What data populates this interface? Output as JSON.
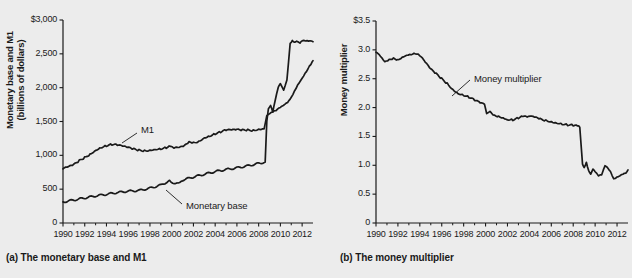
{
  "figure": {
    "background_color": "#ececec",
    "ink_color": "#1a1a1a"
  },
  "panels": [
    {
      "id": "a",
      "caption": "(a) The monetary base and M1",
      "ylabel_line1": "Monetary base and M1",
      "ylabel_line2": "(billions of dollars)",
      "ytick_labels": [
        "$3,000",
        "2,500",
        "2,000",
        "1,500",
        "1,000",
        "500",
        "0"
      ],
      "xtick_labels": [
        "1990",
        "1992",
        "1994",
        "1996",
        "1998",
        "2000",
        "2002",
        "2004",
        "2006",
        "2008",
        "2010",
        "2012"
      ],
      "annotations": [
        {
          "text": "M1",
          "x": 141,
          "y": 131
        },
        {
          "text": "Monetary base",
          "x": 186,
          "y": 207
        }
      ]
    },
    {
      "id": "b",
      "caption": "(b) The money multiplier",
      "ylabel_line1": "Money multiplier",
      "ylabel_line2": "",
      "ytick_labels": [
        "$3.5",
        "3.0",
        "2.5",
        "2.0",
        "1.5",
        "1.0",
        "0.5",
        "0"
      ],
      "xtick_labels": [
        "1990",
        "1992",
        "1994",
        "1996",
        "1998",
        "2000",
        "2002",
        "2004",
        "2006",
        "2008",
        "2010",
        "2012"
      ],
      "annotations": [
        {
          "text": "Money multiplier",
          "x": 474,
          "y": 80
        }
      ]
    }
  ],
  "chart_data": [
    {
      "type": "line",
      "panel": "a",
      "title": "(a) The monetary base and M1",
      "xlabel": "",
      "ylabel": "Monetary base and M1 (billions of dollars)",
      "xlim": [
        1990,
        2013
      ],
      "ylim": [
        0,
        3000
      ],
      "ytick_values": [
        0,
        500,
        1000,
        1500,
        2000,
        2500,
        3000
      ],
      "xtick_values": [
        1990,
        1992,
        1994,
        1996,
        1998,
        2000,
        2002,
        2004,
        2006,
        2008,
        2010,
        2012
      ],
      "grid": false,
      "legend": "inline-annotations",
      "series": [
        {
          "name": "M1",
          "x": [
            1990.0,
            1990.5,
            1991.0,
            1991.5,
            1992.0,
            1992.5,
            1993.0,
            1993.5,
            1994.0,
            1994.5,
            1995.0,
            1995.5,
            1996.0,
            1996.5,
            1997.0,
            1997.5,
            1998.0,
            1998.5,
            1999.0,
            1999.5,
            1999.9,
            2000.2,
            2000.7,
            2001.2,
            2001.6,
            2002.0,
            2002.5,
            2003.0,
            2003.5,
            2004.0,
            2004.5,
            2005.0,
            2005.5,
            2006.0,
            2006.5,
            2007.0,
            2007.5,
            2008.0,
            2008.5,
            2008.75,
            2009.0,
            2009.3,
            2009.6,
            2010.0,
            2010.4,
            2010.8,
            2011.0,
            2011.3,
            2011.6,
            2012.0,
            2012.4,
            2012.8,
            2013.0
          ],
          "y": [
            800,
            825,
            860,
            920,
            970,
            1020,
            1080,
            1120,
            1145,
            1160,
            1150,
            1130,
            1110,
            1090,
            1075,
            1070,
            1080,
            1095,
            1100,
            1115,
            1140,
            1105,
            1110,
            1140,
            1190,
            1185,
            1210,
            1265,
            1290,
            1320,
            1345,
            1370,
            1370,
            1375,
            1370,
            1375,
            1370,
            1390,
            1400,
            1600,
            1625,
            1650,
            1660,
            1700,
            1740,
            1800,
            1850,
            1950,
            2050,
            2150,
            2250,
            2350,
            2400
          ]
        },
        {
          "name": "Monetary base",
          "x": [
            1990.0,
            1991.0,
            1992.0,
            1993.0,
            1994.0,
            1995.0,
            1996.0,
            1997.0,
            1998.0,
            1999.0,
            1999.8,
            2000.1,
            2000.6,
            2001.0,
            2002.0,
            2003.0,
            2004.0,
            2005.0,
            2006.0,
            2007.0,
            2008.0,
            2008.6,
            2008.75,
            2008.9,
            2009.1,
            2009.3,
            2009.5,
            2009.8,
            2010.0,
            2010.3,
            2010.6,
            2010.9,
            2011.1,
            2011.3,
            2011.5,
            2011.8,
            2012.0,
            2012.3,
            2012.6,
            2013.0
          ],
          "y": [
            310,
            340,
            370,
            400,
            425,
            450,
            470,
            480,
            515,
            560,
            625,
            590,
            600,
            635,
            680,
            720,
            760,
            790,
            815,
            845,
            880,
            900,
            1500,
            1700,
            1750,
            1650,
            1800,
            2000,
            2050,
            1950,
            2100,
            2650,
            2700,
            2680,
            2700,
            2670,
            2700,
            2690,
            2680,
            2680
          ]
        }
      ]
    },
    {
      "type": "line",
      "panel": "b",
      "title": "(b) The money multiplier",
      "xlabel": "",
      "ylabel": "Money multiplier",
      "xlim": [
        1990,
        2013
      ],
      "ylim": [
        0,
        3.5
      ],
      "ytick_values": [
        0,
        0.5,
        1.0,
        1.5,
        2.0,
        2.5,
        3.0,
        3.5
      ],
      "xtick_values": [
        1990,
        1992,
        1994,
        1996,
        1998,
        2000,
        2002,
        2004,
        2006,
        2008,
        2010,
        2012
      ],
      "grid": false,
      "legend": "inline-annotations",
      "series": [
        {
          "name": "Money multiplier",
          "x": [
            1990.0,
            1990.4,
            1990.8,
            1991.2,
            1991.6,
            1992.0,
            1992.4,
            1992.8,
            1993.2,
            1993.6,
            1994.0,
            1994.5,
            1995.0,
            1995.5,
            1996.0,
            1996.5,
            1997.0,
            1997.5,
            1998.0,
            1998.5,
            1999.0,
            1999.5,
            1999.9,
            2000.1,
            2000.4,
            2000.8,
            2001.2,
            2001.6,
            2002.0,
            2002.5,
            2003.0,
            2003.4,
            2003.8,
            2004.2,
            2004.6,
            2005.0,
            2005.5,
            2006.0,
            2006.5,
            2007.0,
            2007.5,
            2008.0,
            2008.4,
            2008.6,
            2008.7,
            2008.85,
            2009.0,
            2009.2,
            2009.4,
            2009.6,
            2009.8,
            2010.0,
            2010.3,
            2010.6,
            2010.9,
            2011.1,
            2011.4,
            2011.7,
            2012.0,
            2012.4,
            2012.8,
            2013.0
          ],
          "y": [
            2.96,
            2.88,
            2.78,
            2.82,
            2.85,
            2.83,
            2.88,
            2.92,
            2.93,
            2.94,
            2.9,
            2.78,
            2.66,
            2.58,
            2.5,
            2.42,
            2.32,
            2.25,
            2.22,
            2.18,
            2.13,
            2.08,
            2.05,
            1.88,
            1.92,
            1.86,
            1.85,
            1.83,
            1.8,
            1.79,
            1.82,
            1.85,
            1.83,
            1.84,
            1.82,
            1.8,
            1.78,
            1.76,
            1.74,
            1.72,
            1.7,
            1.69,
            1.68,
            1.66,
            1.4,
            1.02,
            0.95,
            1.05,
            0.92,
            0.86,
            0.95,
            0.9,
            0.82,
            0.83,
            0.98,
            0.95,
            0.88,
            0.76,
            0.8,
            0.85,
            0.88,
            0.92
          ]
        }
      ]
    }
  ]
}
